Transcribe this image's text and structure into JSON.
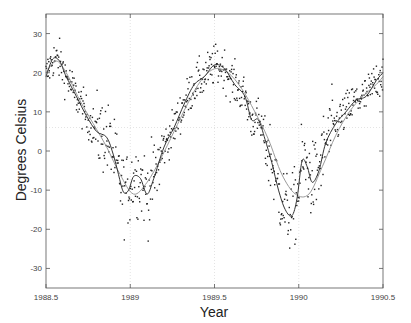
{
  "chart_data": {
    "type": "scatter",
    "title": "",
    "xlabel": "Year",
    "ylabel": "Degrees Celsius",
    "xlim": [
      1988.5,
      1990.5
    ],
    "ylim": [
      -35,
      35
    ],
    "xticks": [
      1988.5,
      1989,
      1989.5,
      1990,
      1990.5
    ],
    "xtick_labels": [
      "1988.5",
      "1989",
      "1989.5",
      "1990",
      "1990.5"
    ],
    "yticks": [
      -30,
      -20,
      -10,
      0,
      10,
      20,
      30
    ],
    "ytick_labels": [
      "-30",
      "-20",
      "-10",
      "0",
      "10",
      "20",
      "30"
    ],
    "grid": {
      "vertical_dotted_at": [
        1989,
        1989.5,
        1990
      ],
      "horizontal_dotted_at": [
        6
      ]
    },
    "legend": null,
    "series": [
      {
        "name": "daily observations",
        "style": "scatter-dots",
        "color": "#222222",
        "description": "noisy daily temperature points scattered around the fitted curves"
      },
      {
        "name": "local fit (dark)",
        "style": "line",
        "color": "#333333",
        "x": [
          1988.5,
          1988.54,
          1988.58,
          1988.62,
          1988.68,
          1988.74,
          1988.8,
          1988.86,
          1988.9,
          1988.93,
          1988.96,
          1988.99,
          1989.02,
          1989.06,
          1989.1,
          1989.14,
          1989.2,
          1989.26,
          1989.32,
          1989.38,
          1989.44,
          1989.5,
          1989.56,
          1989.62,
          1989.68,
          1989.72,
          1989.76,
          1989.8,
          1989.84,
          1989.88,
          1989.92,
          1989.96,
          1989.99,
          1990.02,
          1990.05,
          1990.08,
          1990.12,
          1990.16,
          1990.22,
          1990.28,
          1990.34,
          1990.4,
          1990.46,
          1990.5
        ],
        "y": [
          19,
          23.5,
          23,
          19,
          14,
          9,
          5,
          3.5,
          -1,
          -6,
          -10.5,
          -10,
          -6.5,
          -7,
          -11,
          -7,
          1,
          6,
          12,
          17,
          19,
          22,
          21,
          17,
          14,
          8,
          8,
          3,
          -3,
          -10,
          -15,
          -16.5,
          -12,
          -2.5,
          -4,
          -8,
          -5,
          2,
          7,
          10,
          13,
          14,
          18,
          20
        ]
      },
      {
        "name": "smooth fit (gray)",
        "style": "line",
        "color": "#999999",
        "x": [
          1988.5,
          1988.56,
          1988.62,
          1988.7,
          1988.78,
          1988.86,
          1988.94,
          1989.02,
          1989.1,
          1989.18,
          1989.26,
          1989.34,
          1989.42,
          1989.5,
          1989.58,
          1989.66,
          1989.74,
          1989.82,
          1989.9,
          1989.98,
          1990.06,
          1990.14,
          1990.22,
          1990.3,
          1990.38,
          1990.46,
          1990.5
        ],
        "y": [
          20,
          23,
          20,
          13,
          7,
          1,
          -6,
          -11,
          -8,
          -2,
          5,
          12,
          18,
          21,
          20,
          16,
          10,
          3,
          -6,
          -11,
          -11,
          -4,
          4,
          10,
          14,
          17,
          19
        ]
      }
    ]
  }
}
